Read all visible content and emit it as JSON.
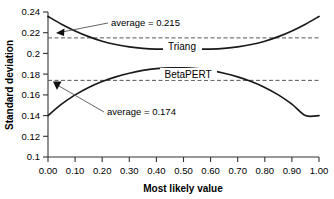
{
  "chart_data": {
    "type": "line",
    "title": "",
    "xlabel": "Most likely value",
    "ylabel": "Standard deviation",
    "xlim": [
      0.0,
      1.0
    ],
    "ylim": [
      0.1,
      0.24
    ],
    "grid": false,
    "legend_position": "inline-labels",
    "xticks": [
      "0.00",
      "0.10",
      "0.20",
      "0.30",
      "0.40",
      "0.50",
      "0.60",
      "0.70",
      "0.80",
      "0.90",
      "1.00"
    ],
    "xtick_values": [
      0.0,
      0.1,
      0.2,
      0.3,
      0.4,
      0.5,
      0.6,
      0.7,
      0.8,
      0.9,
      1.0
    ],
    "yticks": [
      "0.1",
      "0.12",
      "0.14",
      "0.16",
      "0.18",
      "0.2",
      "0.22",
      "0.24"
    ],
    "ytick_values": [
      0.1,
      0.12,
      0.14,
      0.16,
      0.18,
      0.2,
      0.22,
      0.24
    ],
    "x": [
      0.0,
      0.05,
      0.1,
      0.15,
      0.2,
      0.25,
      0.3,
      0.35,
      0.4,
      0.45,
      0.5,
      0.55,
      0.6,
      0.65,
      0.7,
      0.75,
      0.8,
      0.85,
      0.9,
      0.95,
      1.0
    ],
    "series": [
      {
        "name": "Triang",
        "label": "Triang",
        "color": "#1a1a1a",
        "values": [
          0.2357,
          0.2282,
          0.2217,
          0.2162,
          0.2118,
          0.2086,
          0.2063,
          0.2049,
          0.2042,
          0.2041,
          0.2041,
          0.2041,
          0.2042,
          0.2049,
          0.2063,
          0.2086,
          0.2118,
          0.2162,
          0.2217,
          0.2282,
          0.2357
        ],
        "average": 0.215,
        "average_label": "average = 0.215"
      },
      {
        "name": "BetaPERT",
        "label": "BetaPERT",
        "color": "#1a1a1a",
        "values": [
          0.14,
          0.151,
          0.16,
          0.1672,
          0.1729,
          0.1774,
          0.1809,
          0.1836,
          0.1853,
          0.1861,
          0.1861,
          0.1853,
          0.1836,
          0.1809,
          0.1774,
          0.1729,
          0.1672,
          0.16,
          0.151,
          0.14,
          0.14
        ],
        "average": 0.174,
        "average_label": "average = 0.174"
      }
    ],
    "reference_lines": [
      {
        "name": "triang-average-line",
        "value": 0.215,
        "style": "dashed",
        "color": "#555555"
      },
      {
        "name": "betapert-average-line",
        "value": 0.174,
        "style": "dashed",
        "color": "#555555"
      }
    ],
    "annotations": [
      {
        "name": "triang-average-annotation",
        "text": "average = 0.215",
        "target_value": 0.215
      },
      {
        "name": "betapert-average-annotation",
        "text": "average = 0.174",
        "target_value": 0.174
      }
    ]
  },
  "axes": {
    "x_title": "Most likely value",
    "y_title": "Standard deviation"
  },
  "labels": {
    "triang": "Triang",
    "betapert": "BetaPERT",
    "triang_average": "average = 0.215",
    "betapert_average": "average = 0.174"
  }
}
